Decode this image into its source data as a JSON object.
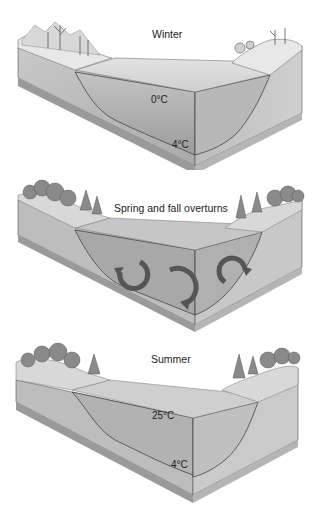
{
  "figure": {
    "panels": [
      {
        "id": "winter",
        "title": "Winter",
        "temperatures": [
          {
            "label": "0°C",
            "position": "surface"
          },
          {
            "label": "4°C",
            "position": "bottom"
          }
        ],
        "surface": "ice"
      },
      {
        "id": "overturn",
        "title": "Spring and fall overturns",
        "temperatures": [],
        "circulation_arrows": 3
      },
      {
        "id": "summer",
        "title": "Summer",
        "temperatures": [
          {
            "label": "25°C",
            "position": "surface"
          },
          {
            "label": "4°C",
            "position": "bottom"
          }
        ],
        "surface": "water"
      }
    ]
  }
}
